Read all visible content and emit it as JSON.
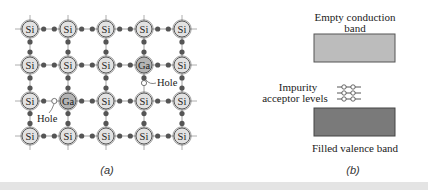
{
  "panel_a": {
    "caption": "(a)",
    "lattice": {
      "columns_x": [
        30,
        68,
        106,
        144,
        182
      ],
      "rows_y": [
        29,
        65,
        101,
        136
      ],
      "atoms": [
        [
          "Si",
          "Si",
          "Si",
          "Si",
          "Si"
        ],
        [
          "Si",
          "Si",
          "Si",
          "Ga",
          "Si"
        ],
        [
          "Si",
          "Ga",
          "Si",
          "Si",
          "Si"
        ],
        [
          "Si",
          "Si",
          "Si",
          "Si",
          "Si"
        ]
      ]
    },
    "holes": [
      {
        "label": "Hole",
        "x": 144,
        "y": 78,
        "label_x": 158,
        "label_y": 85
      },
      {
        "label": "Hole",
        "x": 49,
        "y": 101,
        "label_x": 36,
        "label_y": 119
      }
    ],
    "colors": {
      "si_fill": "#e2e2e2",
      "ga_fill": "#b4b4b4",
      "bond_dot": "#555555",
      "stroke": "#444444"
    }
  },
  "panel_b": {
    "caption": "(b)",
    "conduction_band": {
      "label_line1": "Empty conduction",
      "label_line2": "band",
      "fill": "#bcbcbc"
    },
    "acceptor_levels": {
      "label_line1": "Impurity",
      "label_line2": "acceptor levels",
      "count": 3
    },
    "valence_band": {
      "label": "Filled valence band",
      "fill": "#7a7a7a"
    }
  }
}
